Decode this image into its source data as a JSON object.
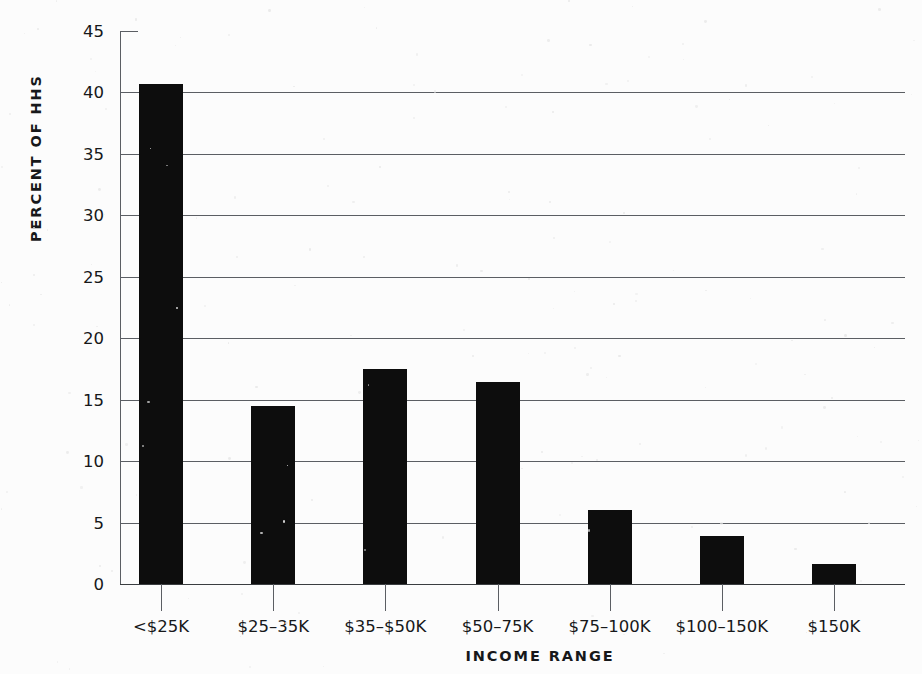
{
  "chart_data": {
    "type": "bar",
    "title": "",
    "xlabel": "INCOME RANGE",
    "ylabel": "PERCENT OF HHS",
    "categories": [
      "<$25K",
      "$25–35K",
      "$35–$50K",
      "$50–75K",
      "$75–100K",
      "$100–150K",
      "$150K"
    ],
    "values": [
      40.7,
      14.5,
      17.5,
      16.4,
      6.0,
      3.9,
      1.6
    ],
    "ylim": [
      0,
      45
    ],
    "ytick_values": [
      0,
      5,
      10,
      15,
      20,
      25,
      30,
      35,
      40,
      45
    ],
    "ytick_labels": [
      "0",
      "5",
      "10",
      "15",
      "20",
      "25",
      "30",
      "35",
      "40",
      "45"
    ],
    "grid": true,
    "legend": false,
    "bar_color": "#0d0d0d",
    "background_color": "#fcfcfc",
    "axis_color": "#5b5e63"
  }
}
